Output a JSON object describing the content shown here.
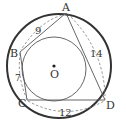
{
  "diagram": {
    "type": "geometry",
    "points": {
      "A": {
        "label": "A",
        "x": 66,
        "y": 12
      },
      "B": {
        "label": "B",
        "x": 20,
        "y": 50
      },
      "C": {
        "label": "C",
        "x": 27,
        "y": 100
      },
      "D": {
        "label": "D",
        "x": 105,
        "y": 100
      },
      "O": {
        "label": "O",
        "x": 54,
        "y": 67
      }
    },
    "segments": {
      "AB": {
        "label": "9"
      },
      "BC": {
        "label": "7"
      },
      "AD": {
        "label": "14"
      },
      "CD": {
        "label": "12"
      }
    },
    "colors": {
      "outer_circle": "#333333",
      "lines": "#555555",
      "dashed": "#777777",
      "text": "#333333"
    }
  }
}
